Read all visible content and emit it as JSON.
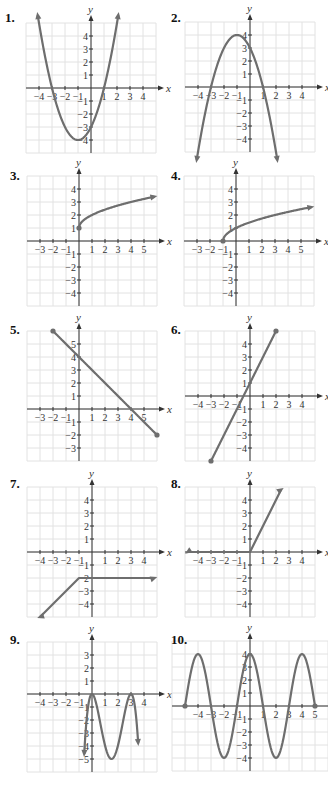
{
  "colors": {
    "curve": "#6e6e6e",
    "grid": "#e2e2e2",
    "axis": "#333333",
    "background": "#ffffff"
  },
  "chart_data": [
    {
      "id": 1,
      "label": "1.",
      "type": "line",
      "title": "",
      "xlabel": "x",
      "ylabel": "y",
      "xticks": [
        "-4",
        "-3",
        "-2",
        "-1",
        "1",
        "2",
        "3",
        "4"
      ],
      "yticks": [
        "-4",
        "-3",
        "-2",
        "-1",
        "1",
        "2",
        "3",
        "4"
      ],
      "xlim": [
        -4.5,
        4.5
      ],
      "ylim": [
        -4.5,
        4.5
      ],
      "grid": true,
      "description": "Upward parabola, vertex (-1,-4), x-intercepts -3 and 1, y-intercept -3, arrows at both ends",
      "points": [
        [
          -4.1,
          5.2
        ],
        [
          -3,
          0
        ],
        [
          -2,
          -3
        ],
        [
          -1,
          -4
        ],
        [
          0,
          -3
        ],
        [
          1,
          0
        ],
        [
          2.1,
          5.2
        ]
      ]
    },
    {
      "id": 2,
      "label": "2.",
      "type": "line",
      "title": "",
      "xlabel": "x",
      "ylabel": "y",
      "xticks": [
        "-4",
        "-3",
        "-2",
        "-1",
        "1",
        "2",
        "3",
        "4"
      ],
      "yticks": [
        "-4",
        "-3",
        "-2",
        "-1",
        "1",
        "2",
        "3",
        "4"
      ],
      "xlim": [
        -4.5,
        4.5
      ],
      "ylim": [
        -4.5,
        4.5
      ],
      "grid": true,
      "description": "Downward parabola, vertex (-1,4), x-intercepts -3 and 1, y-intercept 3, arrows at both ends",
      "points": [
        [
          -4.1,
          -5.2
        ],
        [
          -3,
          0
        ],
        [
          -2,
          3
        ],
        [
          -1,
          4
        ],
        [
          0,
          3
        ],
        [
          1,
          0
        ],
        [
          2.1,
          -5.2
        ]
      ]
    },
    {
      "id": 3,
      "label": "3.",
      "type": "line",
      "title": "",
      "xlabel": "x",
      "ylabel": "y",
      "xticks": [
        "-3",
        "-2",
        "-1",
        "1",
        "2",
        "3",
        "4",
        "5"
      ],
      "yticks": [
        "-4",
        "-3",
        "-2",
        "-1",
        "1",
        "2",
        "3",
        "4"
      ],
      "xlim": [
        -3.5,
        5.5
      ],
      "ylim": [
        -4.5,
        4.5
      ],
      "grid": true,
      "description": "y = sqrt(x) + 1 starting at closed point (0,1), arrow to the right",
      "points": [
        [
          0,
          1
        ],
        [
          1,
          2
        ],
        [
          4,
          3
        ],
        [
          5.8,
          3.4
        ]
      ]
    },
    {
      "id": 4,
      "label": "4.",
      "type": "line",
      "title": "",
      "xlabel": "x",
      "ylabel": "y",
      "xticks": [
        "-3",
        "-2",
        "-1",
        "1",
        "2",
        "3",
        "4",
        "5"
      ],
      "yticks": [
        "-4",
        "-3",
        "-2",
        "-1",
        "1",
        "2",
        "3",
        "4"
      ],
      "xlim": [
        -3.5,
        5.5
      ],
      "ylim": [
        -4.5,
        4.5
      ],
      "grid": true,
      "description": "y = sqrt(x+1) starting at closed point (-1,0), arrow to the right",
      "points": [
        [
          -1,
          0
        ],
        [
          0,
          1
        ],
        [
          3,
          2
        ],
        [
          5.8,
          2.6
        ]
      ]
    },
    {
      "id": 5,
      "label": "5.",
      "type": "line",
      "title": "",
      "xlabel": "x",
      "ylabel": "y",
      "xticks": [
        "-3",
        "-2",
        "-1",
        "1",
        "2",
        "3",
        "4",
        "5"
      ],
      "yticks": [
        "-3",
        "-2",
        "-1",
        "1",
        "2",
        "3",
        "4",
        "5"
      ],
      "xlim": [
        -3.5,
        5.5
      ],
      "ylim": [
        -3.5,
        5.5
      ],
      "grid": true,
      "description": "Line segment from (-2,6) to (6,-2), y-intercept 4, x-intercept 4, closed endpoints",
      "points": [
        [
          -2,
          6
        ],
        [
          6,
          -2
        ]
      ]
    },
    {
      "id": 6,
      "label": "6.",
      "type": "line",
      "title": "",
      "xlabel": "x",
      "ylabel": "y",
      "xticks": [
        "-4",
        "-3",
        "-2",
        "-1",
        "1",
        "2",
        "3",
        "4"
      ],
      "yticks": [
        "-4",
        "-3",
        "-2",
        "-1",
        "1",
        "2",
        "3",
        "4"
      ],
      "xlim": [
        -4.5,
        4.5
      ],
      "ylim": [
        -4.5,
        4.5
      ],
      "grid": true,
      "description": "Line segment from (-3,-5) to (2,5), slope 2, y-intercept 1, closed endpoints",
      "points": [
        [
          -3,
          -5
        ],
        [
          2,
          5
        ]
      ]
    },
    {
      "id": 7,
      "label": "7.",
      "type": "line",
      "title": "",
      "xlabel": "x",
      "ylabel": "y",
      "xticks": [
        "-4",
        "-3",
        "-2",
        "-1",
        "1",
        "2",
        "3",
        "4"
      ],
      "yticks": [
        "-4",
        "-3",
        "-2",
        "-1",
        "1",
        "2",
        "3",
        "4"
      ],
      "xlim": [
        -4.5,
        4.5
      ],
      "ylim": [
        -4.5,
        4.5
      ],
      "grid": true,
      "description": "Piecewise: rising line to (-1,-2) then horizontal y=-2 to the right, arrows at both ends",
      "points": [
        [
          -4,
          -5
        ],
        [
          -1,
          -2
        ],
        [
          4.8,
          -2
        ]
      ]
    },
    {
      "id": 8,
      "label": "8.",
      "type": "line",
      "title": "",
      "xlabel": "x",
      "ylabel": "y",
      "xticks": [
        "-4",
        "-3",
        "-2",
        "-1",
        "1",
        "2",
        "3",
        "4"
      ],
      "yticks": [
        "-4",
        "-3",
        "-2",
        "-1",
        "1",
        "2",
        "3",
        "4"
      ],
      "xlim": [
        -4.5,
        4.5
      ],
      "ylim": [
        -4.5,
        4.5
      ],
      "grid": true,
      "description": "Piecewise: y=0 for x<0 (arrow left), y=2x for x>=0 (arrow up-right)",
      "points": [
        [
          -4.8,
          0
        ],
        [
          0,
          0
        ],
        [
          2.4,
          4.8
        ]
      ]
    },
    {
      "id": 9,
      "label": "9.",
      "type": "line",
      "title": "",
      "xlabel": "x",
      "ylabel": "y",
      "xticks": [
        "-4",
        "-3",
        "-2",
        "-1",
        "1",
        "2",
        "3",
        "4"
      ],
      "yticks": [
        "-5",
        "-4",
        "-3",
        "-2",
        "-1",
        "1",
        "2",
        "3"
      ],
      "xlim": [
        -4.5,
        4.5
      ],
      "ylim": [
        -5.5,
        3.5
      ],
      "grid": true,
      "description": "Cubic-like curve with local max at (0,0), local min at (1.5,-5), local max at (3,0), arrows downward at both ends",
      "points": [
        [
          -0.7,
          -6
        ],
        [
          0,
          0
        ],
        [
          1.5,
          -5
        ],
        [
          3,
          0
        ],
        [
          3.6,
          -6
        ]
      ]
    },
    {
      "id": 10,
      "label": "10.",
      "type": "line",
      "title": "",
      "xlabel": "x",
      "ylabel": "y",
      "xticks": [
        "-4",
        "-3",
        "-2",
        "-1",
        "1",
        "2",
        "3",
        "4",
        "5"
      ],
      "yticks": [
        "-4",
        "-3",
        "-2",
        "-1",
        "1",
        "2",
        "3",
        "4"
      ],
      "xlim": [
        -5,
        5
      ],
      "ylim": [
        -4.5,
        4.5
      ],
      "grid": true,
      "description": "Cosine-like wave y=4cos(pi x/4)... amplitude 4, period 4, from closed point (-5,0) to closed point (5,0); maxima at -4,0,4; minima at -2,2",
      "points": [
        [
          -5,
          0
        ],
        [
          -4,
          4
        ],
        [
          -3,
          0
        ],
        [
          -2,
          -4
        ],
        [
          -1,
          0
        ],
        [
          0,
          4
        ],
        [
          1,
          0
        ],
        [
          2,
          -4
        ],
        [
          3,
          0
        ],
        [
          4,
          4
        ],
        [
          5,
          0
        ]
      ]
    }
  ],
  "panels": [
    {
      "label": "1."
    },
    {
      "label": "2."
    },
    {
      "label": "3."
    },
    {
      "label": "4."
    },
    {
      "label": "5."
    },
    {
      "label": "6."
    },
    {
      "label": "7."
    },
    {
      "label": "8."
    },
    {
      "label": "9."
    },
    {
      "label": "10."
    }
  ]
}
